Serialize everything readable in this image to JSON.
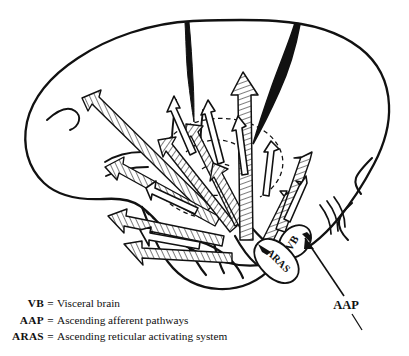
{
  "figure": {
    "ink_color": "#111111",
    "background": "#ffffff",
    "labels": {
      "vb": "VB",
      "aras": "ARAS",
      "aap": "AAP"
    }
  },
  "legend": {
    "rows": [
      {
        "abbr": "VB",
        "eq": "=",
        "desc": "Visceral brain"
      },
      {
        "abbr": "AAP",
        "eq": "=",
        "desc": "Ascending afferent pathways"
      },
      {
        "abbr": "ARAS",
        "eq": "=",
        "desc": "Ascending reticular activating system"
      }
    ]
  }
}
